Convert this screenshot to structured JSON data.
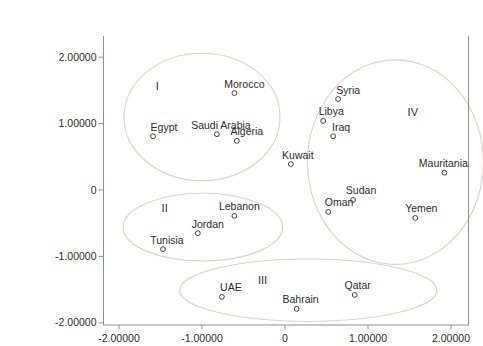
{
  "figure": {
    "width": 443,
    "height": 340,
    "colors": {
      "background": "#ffffff",
      "axis": "#8f8f8f",
      "ellipse_stroke": "#d8d4cb",
      "marker_stroke": "#3f3f3f",
      "text": "#2a2a2a"
    }
  },
  "chart_data": {
    "type": "scatter",
    "title": "",
    "xlabel": "",
    "ylabel": "",
    "xlim": [
      -2.19,
      2.21
    ],
    "ylim": [
      -2.03,
      2.32
    ],
    "grid": false,
    "legend": "none",
    "marker_style": "open-circle",
    "x_ticks": [
      {
        "value": -2,
        "label": "-2.00000"
      },
      {
        "value": -1,
        "label": "-1.00000"
      },
      {
        "value": 0,
        "label": "0"
      },
      {
        "value": 1,
        "label": "1.00000"
      },
      {
        "value": 2,
        "label": "2.00000"
      }
    ],
    "y_ticks": [
      {
        "value": 2,
        "label": "2.00000"
      },
      {
        "value": 1,
        "label": "1.00000"
      },
      {
        "value": 0,
        "label": "0"
      },
      {
        "value": -1,
        "label": "-1.00000"
      },
      {
        "value": -2,
        "label": "-2.00000"
      }
    ],
    "points": [
      {
        "name": "Morocco",
        "x": -0.61,
        "y": 1.46,
        "label_dx": 10
      },
      {
        "name": "Egypt",
        "x": -1.59,
        "y": 0.81,
        "label_dx": 11
      },
      {
        "name": "Saudi Arabia",
        "x": -0.82,
        "y": 0.84,
        "label_dx": 4
      },
      {
        "name": "Algeria",
        "x": -0.58,
        "y": 0.74,
        "label_dx": 10
      },
      {
        "name": "Syria",
        "x": 0.64,
        "y": 1.37,
        "label_dx": 10
      },
      {
        "name": "Libya",
        "x": 0.46,
        "y": 1.04,
        "label_dx": 8
      },
      {
        "name": "Iraq",
        "x": 0.58,
        "y": 0.81,
        "label_dx": 8
      },
      {
        "name": "Kuwait",
        "x": 0.07,
        "y": 0.39,
        "label_dx": 7
      },
      {
        "name": "Mauritania",
        "x": 1.92,
        "y": 0.26,
        "label_dx": -1
      },
      {
        "name": "Sudan",
        "x": 0.82,
        "y": -0.15,
        "label_dx": 8
      },
      {
        "name": "Oman",
        "x": 0.52,
        "y": -0.33,
        "label_dx": 11
      },
      {
        "name": "Yemen",
        "x": 1.57,
        "y": -0.42,
        "label_dx": 6
      },
      {
        "name": "Lebanon",
        "x": -0.61,
        "y": -0.39,
        "label_dx": 5
      },
      {
        "name": "Jordan",
        "x": -1.05,
        "y": -0.65,
        "label_dx": 10
      },
      {
        "name": "Tunisia",
        "x": -1.47,
        "y": -0.89,
        "label_dx": 4
      },
      {
        "name": "UAE",
        "x": -0.76,
        "y": -1.61,
        "label_dx": 9
      },
      {
        "name": "Bahrain",
        "x": 0.14,
        "y": -1.79,
        "label_dx": 4
      },
      {
        "name": "Qatar",
        "x": 0.84,
        "y": -1.58,
        "label_dx": 3
      }
    ],
    "clusters": [
      {
        "label": "I",
        "label_x": -1.54,
        "label_y": 1.57,
        "ellipse": {
          "cx": -1.0,
          "cy": 1.1,
          "rx": 0.94,
          "ry": 0.96
        }
      },
      {
        "label": "II",
        "label_x": -1.45,
        "label_y": -0.27,
        "ellipse": {
          "cx": -0.99,
          "cy": -0.56,
          "rx": 0.96,
          "ry": 0.51
        }
      },
      {
        "label": "III",
        "label_x": -0.27,
        "label_y": -1.36,
        "ellipse": {
          "cx": 0.28,
          "cy": -1.51,
          "rx": 1.55,
          "ry": 0.47
        }
      },
      {
        "label": "IV",
        "label_x": 1.54,
        "label_y": 1.17,
        "ellipse": {
          "cx": 1.33,
          "cy": 0.42,
          "rx": 1.06,
          "ry": 1.54
        }
      }
    ]
  }
}
